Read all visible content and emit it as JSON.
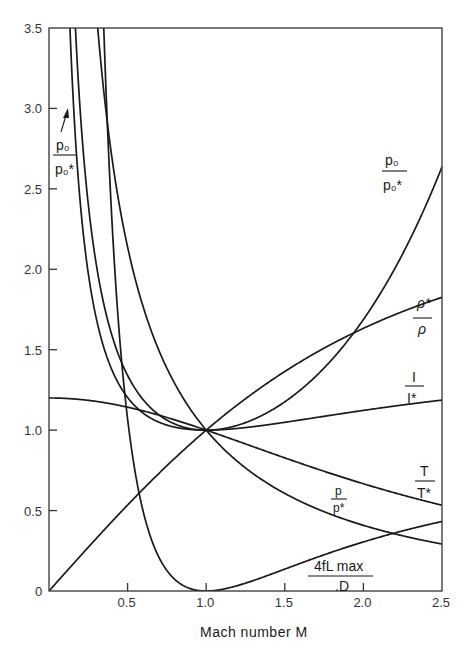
{
  "chart_data": {
    "type": "line",
    "title": "",
    "xlabel": "Mach number M",
    "ylabel": "",
    "xlim": [
      0,
      2.5
    ],
    "ylim": [
      0,
      3.5
    ],
    "grid": false,
    "legend": "inline curve labels",
    "x_ticks": [
      "0",
      "0.5",
      "1.0",
      "1.5",
      "2.0",
      "2.5"
    ],
    "y_ticks": [
      "0",
      "0.5",
      "1.0",
      "1.5",
      "2.0",
      "2.5",
      "3.0",
      "3.5"
    ],
    "x": [
      0.1,
      0.2,
      0.3,
      0.4,
      0.5,
      0.6,
      0.7,
      0.8,
      0.9,
      1.0,
      1.2,
      1.4,
      1.6,
      1.8,
      2.0,
      2.2,
      2.4,
      2.5
    ],
    "series": [
      {
        "name": "p0/p0*",
        "label_num": "p₀",
        "label_den": "p₀*",
        "values": [
          5.82,
          2.96,
          2.04,
          1.59,
          1.34,
          1.19,
          1.09,
          1.04,
          1.01,
          1.0,
          1.03,
          1.11,
          1.25,
          1.44,
          1.69,
          2.01,
          2.4,
          2.64
        ]
      },
      {
        "name": "rho*/rho",
        "label_num": "ρ*",
        "label_den": "ρ",
        "values": [
          0.11,
          0.22,
          0.33,
          0.43,
          0.53,
          0.63,
          0.73,
          0.83,
          0.91,
          1.0,
          1.16,
          1.3,
          1.43,
          1.54,
          1.63,
          1.72,
          1.79,
          1.83
        ]
      },
      {
        "name": "I/I*",
        "label_num": "I",
        "label_den": "I*",
        "values": [
          4.62,
          2.35,
          1.62,
          1.27,
          1.11,
          1.04,
          1.01,
          1.0,
          1.0,
          1.0,
          1.01,
          1.03,
          1.06,
          1.09,
          1.12,
          1.15,
          1.17,
          1.19
        ]
      },
      {
        "name": "T/T*",
        "label_num": "T",
        "label_den": "T*",
        "values": [
          1.2,
          1.19,
          1.18,
          1.16,
          1.14,
          1.12,
          1.09,
          1.06,
          1.03,
          1.0,
          0.93,
          0.86,
          0.79,
          0.73,
          0.67,
          0.61,
          0.56,
          0.53
        ]
      },
      {
        "name": "p/p*",
        "label_num": "p",
        "label_den": "p*",
        "values": [
          10.94,
          5.46,
          3.62,
          2.7,
          2.14,
          1.76,
          1.49,
          1.29,
          1.13,
          1.0,
          0.8,
          0.66,
          0.56,
          0.47,
          0.41,
          0.35,
          0.31,
          0.29
        ]
      },
      {
        "name": "4fLmax/D",
        "label_num": "4fL max",
        "label_den": ".D",
        "values": [
          66.92,
          14.53,
          5.3,
          2.31,
          1.07,
          0.49,
          0.21,
          0.07,
          0.01,
          0.0,
          0.03,
          0.1,
          0.17,
          0.24,
          0.31,
          0.36,
          0.41,
          0.43
        ]
      }
    ],
    "annotations": [
      {
        "text": "p0/p0*",
        "arrow_to": [
          0.13,
          3.0
        ]
      }
    ]
  }
}
